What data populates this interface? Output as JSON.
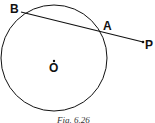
{
  "diagram": {
    "labels": {
      "B": "B",
      "A": "A",
      "P": "P",
      "O": "O"
    },
    "caption": "Fig. 6.26",
    "colors": {
      "stroke": "#111111",
      "background": "#ffffff"
    }
  }
}
